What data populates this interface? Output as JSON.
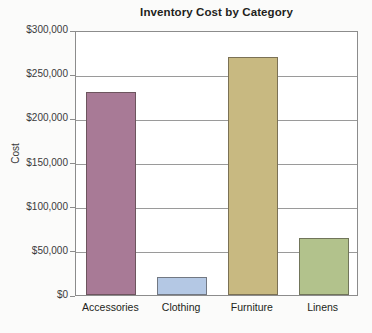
{
  "chart_data": {
    "type": "bar",
    "title": "Inventory Cost by Category",
    "xlabel": "",
    "ylabel": "Cost",
    "categories": [
      "Accessories",
      "Clothing",
      "Furniture",
      "Linens"
    ],
    "values": [
      230000,
      20000,
      270000,
      65000
    ],
    "value_labels": [
      "$230,000",
      "$20,000",
      "$270,000",
      "$65,000"
    ],
    "ylim": [
      0,
      300000
    ],
    "ytick_values": [
      0,
      50000,
      100000,
      150000,
      200000,
      250000,
      300000
    ],
    "ytick_labels": [
      "$0",
      "$50,000",
      "$100,000",
      "$150,000",
      "$200,000",
      "$250,000",
      "$300,000"
    ],
    "bar_colors": [
      "#a87a96",
      "#b4c8e4",
      "#c8b981",
      "#b2c28c"
    ],
    "grid": true,
    "grid_axis": "y",
    "legend": false,
    "legend_position": "none",
    "plot_background": "#ffffff",
    "frame_color": "#8c8c8c",
    "gridline_color": "#9a9a9a",
    "text_color": "#231f20"
  }
}
